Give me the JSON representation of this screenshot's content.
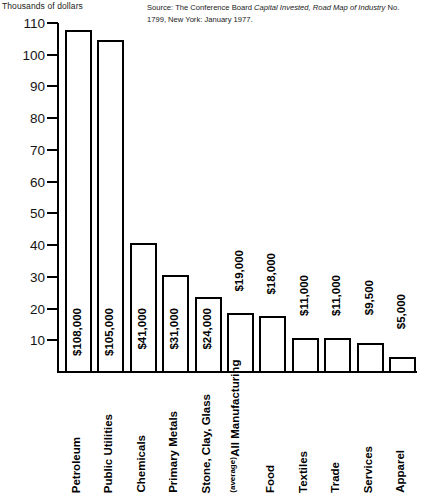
{
  "axis_title": "Thousands of dollars",
  "source": {
    "prefix": "Source: The Conference Board ",
    "italic": "Capital Invested, Road Map of Industry",
    "suffix": " No. 1799, New York: January 1977."
  },
  "chart_data": {
    "type": "bar",
    "title": "",
    "subtitle": "",
    "xlabel": "",
    "ylabel": "Thousands of dollars",
    "ylim": [
      0,
      110
    ],
    "yticks": [
      110,
      100,
      90,
      80,
      70,
      60,
      50,
      40,
      30,
      20,
      10
    ],
    "ytick_labels": [
      "110",
      "100",
      "90",
      "80",
      "70",
      "60",
      "50",
      "40",
      "30",
      "20",
      "10"
    ],
    "grid": false,
    "legend": "none",
    "orientation": "vertical",
    "bar_style": {
      "fill": "#ffffff",
      "edge": "#000000"
    },
    "categories": [
      "Petroleum",
      "Public Utilities",
      "Chemicals",
      "Primary Metals",
      "Stone, Clay, Glass",
      "All Manufacturing",
      "Food",
      "Textiles",
      "Trade",
      "Services",
      "Apparel"
    ],
    "category_sublabels": [
      "",
      "",
      "",
      "",
      "",
      "(average)",
      "",
      "",
      "",
      "",
      ""
    ],
    "values": [
      108,
      105,
      41,
      31,
      24,
      19,
      18,
      11,
      11,
      9.5,
      5
    ],
    "value_labels": [
      "$108,000",
      "$105,000",
      "$41,000",
      "$31,000",
      "$24,000",
      "$19,000",
      "$18,000",
      "$11,000",
      "$11,000",
      "$9,500",
      "$5,000"
    ],
    "value_units": "thousands of dollars"
  }
}
